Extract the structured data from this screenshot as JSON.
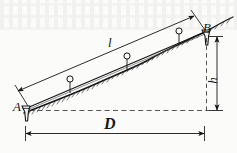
{
  "figure": {
    "background_color": "#fbfbfa",
    "ink_color": "#141414",
    "labels": {
      "point_a": "A",
      "point_b": "B",
      "slope_length": "l",
      "horizontal_distance": "D",
      "height_difference": "h"
    },
    "elements": {
      "tape_line_name": "measuring-tape-line",
      "ground_line_name": "ground-surface-line",
      "plumb_bob_count": 3,
      "stake_a_name": "survey-stake-a",
      "stake_b_name": "survey-stake-b"
    }
  },
  "geometry": {
    "point_a": {
      "x": 25,
      "y": 110
    },
    "point_b": {
      "x": 206,
      "y": 33
    },
    "tape_start": {
      "x": 27,
      "y": 107
    },
    "tape_end": {
      "x": 205,
      "y": 31
    },
    "dim_l": {
      "x1": 16,
      "y1": 92,
      "x2": 196,
      "y2": 15
    },
    "dim_h": {
      "x": 216,
      "y1": 35,
      "y2": 112
    },
    "dim_D": {
      "x1": 24,
      "x2": 205,
      "y": 133
    },
    "dashed_horizontal": {
      "x1": 28,
      "x2": 207,
      "y": 110
    },
    "dashed_vertical": {
      "x": 206,
      "y1": 36,
      "y2": 112
    },
    "plumb_bobs": [
      {
        "cx": 70,
        "cy": 79,
        "len": 12
      },
      {
        "cx": 127,
        "cy": 56,
        "len": 12
      },
      {
        "cx": 179,
        "cy": 31,
        "len": 11
      }
    ]
  }
}
